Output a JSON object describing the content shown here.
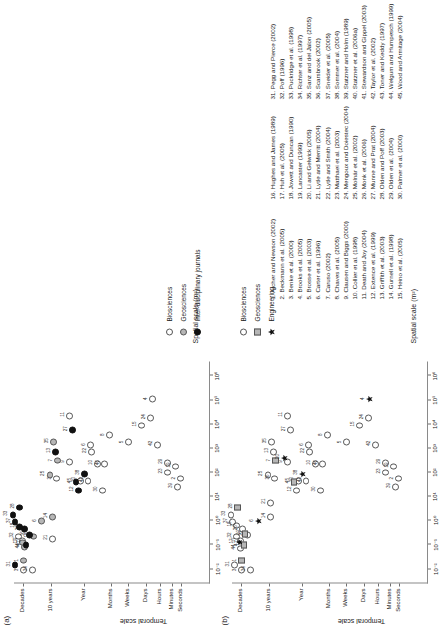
{
  "figure": {
    "panels": [
      {
        "id": "a",
        "label": "(a)",
        "xlabel": "Spatial scale (m²)",
        "ylabel": "Temporal scale",
        "legend": [
          {
            "label": "Biosciences",
            "marker": "open-circle"
          },
          {
            "label": "Geosciences",
            "marker": "gray-circle"
          },
          {
            "label": "Inter-disciplinary journals",
            "marker": "black-circle"
          }
        ]
      },
      {
        "id": "b",
        "label": "(b)",
        "xlabel": "Spatial scale (m²)",
        "ylabel": "Temporal scale",
        "legend": [
          {
            "label": "Biosciences",
            "marker": "open-circle"
          },
          {
            "label": "Geosciences",
            "marker": "gray-square"
          },
          {
            "label": "Engineering",
            "marker": "black-star"
          }
        ]
      }
    ],
    "xticks": [
      "10⁻²",
      "10⁻¹",
      "10⁰",
      "10¹",
      "10²",
      "10³",
      "10⁴",
      "10⁵",
      "10⁶"
    ],
    "yticks": [
      "Decades",
      "10 years",
      "Year",
      "Months",
      "Weeks",
      "Days",
      "Hours",
      "Minutes",
      "Seconds"
    ]
  },
  "references": [
    "1. Archer and Newson (2002)",
    "2. Beckmann et al. (2005)",
    "3. Benke et al. (2000)",
    "4. Brooks et al. (2005)",
    "5. Brosse et al. (2003)",
    "6. Carter et al. (1996)",
    "7. Caruso (2002)",
    "8. Chaves et al. (2005)",
    "9. Clausen and Biggs (2000)",
    "10. Collier et al. (1998)",
    "11. Death and Joy (2004)",
    "12. Extence et al. (1999)",
    "13. Griffith et al. (2003)",
    "14. Gurnell et al. (1998)",
    "15. Heino et al. (2005)",
    "16. Hughes and James (1989)",
    "17. Huh et al. (2005)",
    "18. Jowett and Duncan (1990)",
    "19. Lancaster (1999)",
    "20. Li and Gelwick (2005)",
    "21. Lytle and Merritt (2004)",
    "22. Lytle and Smith (2004)",
    "23. Matthaei et al. (2003)",
    "24. Mengoux and Doiestec (2004)",
    "25. Molnár et al. (2002)",
    "26. Monk et al. (2006)",
    "27. Munne and Prat (2004)",
    "28. Olden and Poff (2003)",
    "29. Olden et al. (2004)",
    "30. Palmer et al. (2000)",
    "31. Pegg and Pierce (2002)",
    "32. Poff (1996)",
    "33. Puckridge et al. (1998)",
    "34. Richter et al. (1997)",
    "35. Sanz and del Jalon (2005)",
    "36. Scarsbrook (2002)",
    "37. Sneider et al. (2005)",
    "38. Sommer et al. (2004)",
    "39. Statzner and Holm (1989)",
    "40. Statzner et al. (2006a)",
    "41. Stewardson and Gippel (2003)",
    "42. Taylor et al. (2002)",
    "43. Toner and Keddy (1997)",
    "44. Welgum and Humpesch (1999)",
    "45. Wood and Armitage (2004)"
  ],
  "chart_data": {
    "type": "scatter",
    "title": "",
    "xlabel": "Spatial scale (m²)",
    "ylabel": "Temporal scale",
    "xlim": [
      -2.6,
      6.6
    ],
    "ylim": [
      0,
      9
    ],
    "x_tick_values": [
      -2,
      -1,
      0,
      1,
      2,
      3,
      4,
      5,
      6
    ],
    "x_tick_labels": [
      "10⁻²",
      "10⁻¹",
      "10⁰",
      "10¹",
      "10²",
      "10³",
      "10⁴",
      "10⁵",
      "10⁶"
    ],
    "y_tick_values": [
      8.6,
      7.3,
      5.8,
      4.55,
      3.75,
      2.95,
      2.3,
      1.75,
      1.35
    ],
    "y_tick_labels": [
      "Decades",
      "10 years",
      "Year",
      "Months",
      "Weeks",
      "Days",
      "Hours",
      "Minutes",
      "Seconds"
    ],
    "grid": false,
    "panels": [
      {
        "id": "a",
        "legend_position": "below-left",
        "series": [
          {
            "name": "Biosciences",
            "marker": "open-circle",
            "points": [
              {
                "id": "34",
                "x": -2.05,
                "y": 8.15
              },
              {
                "id": "3",
                "x": -2.05,
                "y": 8.55
              },
              {
                "id": "32",
                "x": -0.65,
                "y": 8.78
              },
              {
                "id": "17",
                "x": -0.85,
                "y": 8.62
              },
              {
                "id": "21",
                "x": -0.75,
                "y": 7.25
              },
              {
                "id": "9",
                "x": 2.45,
                "y": 6.45
              },
              {
                "id": "36",
                "x": 1.75,
                "y": 7.05
              },
              {
                "id": "11",
                "x": 4.35,
                "y": 6.45
              },
              {
                "id": "20",
                "x": 1.65,
                "y": 5.95
              },
              {
                "id": "43",
                "x": 1.65,
                "y": 5.6
              },
              {
                "id": "30",
                "x": 1.25,
                "y": 4.95
              },
              {
                "id": "10",
                "x": 2.35,
                "y": 5.15
              },
              {
                "id": "40",
                "x": 2.35,
                "y": 4.85
              },
              {
                "id": "22",
                "x": 2.85,
                "y": 5.45
              },
              {
                "id": "6",
                "x": 3.15,
                "y": 5.5
              },
              {
                "id": "8",
                "x": 3.55,
                "y": 4.6
              },
              {
                "id": "5",
                "x": 3.25,
                "y": 3.75
              },
              {
                "id": "15",
                "x": 3.95,
                "y": 3.15
              },
              {
                "id": "24",
                "x": 4.25,
                "y": 2.75
              },
              {
                "id": "4",
                "x": 5.05,
                "y": 2.65
              },
              {
                "id": "42",
                "x": 3.15,
                "y": 2.4
              },
              {
                "id": "23",
                "x": 2.0,
                "y": 1.95
              },
              {
                "id": "29",
                "x": 2.4,
                "y": 1.95
              },
              {
                "id": "19",
                "x": 2.25,
                "y": 1.6
              },
              {
                "id": "39",
                "x": 1.4,
                "y": 1.5
              },
              {
                "id": "2",
                "x": 1.75,
                "y": 1.35
              }
            ]
          },
          {
            "name": "Geosciences",
            "marker": "gray-circle",
            "points": [
              {
                "id": "1",
                "x": -1.65,
                "y": 8.55
              },
              {
                "id": "44",
                "x": -1.1,
                "y": 8.52
              },
              {
                "id": "17",
                "x": -0.9,
                "y": 8.6
              },
              {
                "id": "14",
                "x": 0.15,
                "y": 7.25
              },
              {
                "id": "6",
                "x": 0.0,
                "y": 7.75
              },
              {
                "id": "25",
                "x": 1.9,
                "y": 7.35
              },
              {
                "id": "7",
                "x": 2.5,
                "y": 7.0
              },
              {
                "id": "35",
                "x": 3.25,
                "y": 7.2
              },
              {
                "id": "18",
                "x": -0.65,
                "y": 8.1
              }
            ]
          },
          {
            "name": "Inter-disciplinary journals",
            "marker": "black-circle",
            "points": [
              {
                "id": "31",
                "x": -1.85,
                "y": 8.95
              },
              {
                "id": "41",
                "x": -1.0,
                "y": 8.45
              },
              {
                "id": "16",
                "x": -0.6,
                "y": 8.3
              },
              {
                "id": "26",
                "x": -0.35,
                "y": 8.5
              },
              {
                "id": "18",
                "x": -0.25,
                "y": 8.75
              },
              {
                "id": "37",
                "x": -0.05,
                "y": 8.95
              },
              {
                "id": "33",
                "x": 0.25,
                "y": 9.05
              },
              {
                "id": "28",
                "x": 0.55,
                "y": 8.75
              },
              {
                "id": "13",
                "x": 2.85,
                "y": 7.1
              },
              {
                "id": "27",
                "x": 3.75,
                "y": 6.3
              },
              {
                "id": "12",
                "x": 1.25,
                "y": 6.05
              },
              {
                "id": "45",
                "x": 1.6,
                "y": 6.15
              },
              {
                "id": "38",
                "x": 1.95,
                "y": 5.75
              }
            ]
          }
        ]
      },
      {
        "id": "b",
        "legend_position": "right",
        "series": [
          {
            "name": "Biosciences",
            "marker": "open-circle",
            "points": [
              {
                "id": "34",
                "x": -2.05,
                "y": 8.15
              },
              {
                "id": "3",
                "x": -2.05,
                "y": 8.55
              },
              {
                "id": "31",
                "x": -1.85,
                "y": 8.9
              },
              {
                "id": "44",
                "x": -1.15,
                "y": 8.6
              },
              {
                "id": "17",
                "x": -0.85,
                "y": 8.62
              },
              {
                "id": "32",
                "x": -0.65,
                "y": 8.8
              },
              {
                "id": "16",
                "x": -0.6,
                "y": 8.3
              },
              {
                "id": "26",
                "x": -0.35,
                "y": 8.5
              },
              {
                "id": "18",
                "x": -0.2,
                "y": 8.78
              },
              {
                "id": "37",
                "x": -0.05,
                "y": 8.98
              },
              {
                "id": "33",
                "x": 0.25,
                "y": 9.05
              },
              {
                "id": "14",
                "x": 0.15,
                "y": 7.25
              },
              {
                "id": "21",
                "x": 0.75,
                "y": 7.25
              },
              {
                "id": "12",
                "x": 1.25,
                "y": 6.05
              },
              {
                "id": "36",
                "x": 1.75,
                "y": 7.05
              },
              {
                "id": "25",
                "x": 1.9,
                "y": 7.35
              },
              {
                "id": "9",
                "x": 2.45,
                "y": 6.45
              },
              {
                "id": "27",
                "x": 3.75,
                "y": 6.3
              },
              {
                "id": "13",
                "x": 2.85,
                "y": 7.1
              },
              {
                "id": "35",
                "x": 3.25,
                "y": 7.2
              },
              {
                "id": "11",
                "x": 4.35,
                "y": 6.45
              },
              {
                "id": "20",
                "x": 1.65,
                "y": 5.95
              },
              {
                "id": "43",
                "x": 1.65,
                "y": 5.6
              },
              {
                "id": "30",
                "x": 1.25,
                "y": 4.95
              },
              {
                "id": "10",
                "x": 2.35,
                "y": 5.15
              },
              {
                "id": "40",
                "x": 2.35,
                "y": 4.85
              },
              {
                "id": "22",
                "x": 2.85,
                "y": 5.45
              },
              {
                "id": "6",
                "x": 3.15,
                "y": 5.5
              },
              {
                "id": "8",
                "x": 3.55,
                "y": 4.6
              },
              {
                "id": "5",
                "x": 3.25,
                "y": 3.75
              },
              {
                "id": "15",
                "x": 3.95,
                "y": 3.15
              },
              {
                "id": "24",
                "x": 4.25,
                "y": 2.75
              },
              {
                "id": "42",
                "x": 3.15,
                "y": 2.4
              },
              {
                "id": "23",
                "x": 2.0,
                "y": 1.95
              },
              {
                "id": "29",
                "x": 2.4,
                "y": 1.95
              },
              {
                "id": "19",
                "x": 2.25,
                "y": 1.6
              },
              {
                "id": "39",
                "x": 1.4,
                "y": 1.5
              },
              {
                "id": "2",
                "x": 1.75,
                "y": 1.35
              }
            ]
          },
          {
            "name": "Geosciences",
            "marker": "gray-square",
            "points": [
              {
                "id": "1",
                "x": -1.65,
                "y": 8.55
              },
              {
                "id": "41",
                "x": -1.0,
                "y": 8.45
              },
              {
                "id": "19",
                "x": -0.55,
                "y": 8.4
              },
              {
                "id": "28",
                "x": 0.55,
                "y": 8.75
              },
              {
                "id": "45",
                "x": 1.6,
                "y": 6.15
              },
              {
                "id": "7",
                "x": 2.5,
                "y": 7.0
              }
            ]
          },
          {
            "name": "Engineering",
            "marker": "black-star",
            "points": [
              {
                "id": "17",
                "x": -0.9,
                "y": 8.68
              },
              {
                "id": "6",
                "x": 0.0,
                "y": 7.78
              },
              {
                "id": "38",
                "x": 1.95,
                "y": 5.75
              },
              {
                "id": "20",
                "x": 2.6,
                "y": 6.6
              },
              {
                "id": "4",
                "x": 5.05,
                "y": 2.7
              }
            ]
          }
        ]
      }
    ]
  }
}
